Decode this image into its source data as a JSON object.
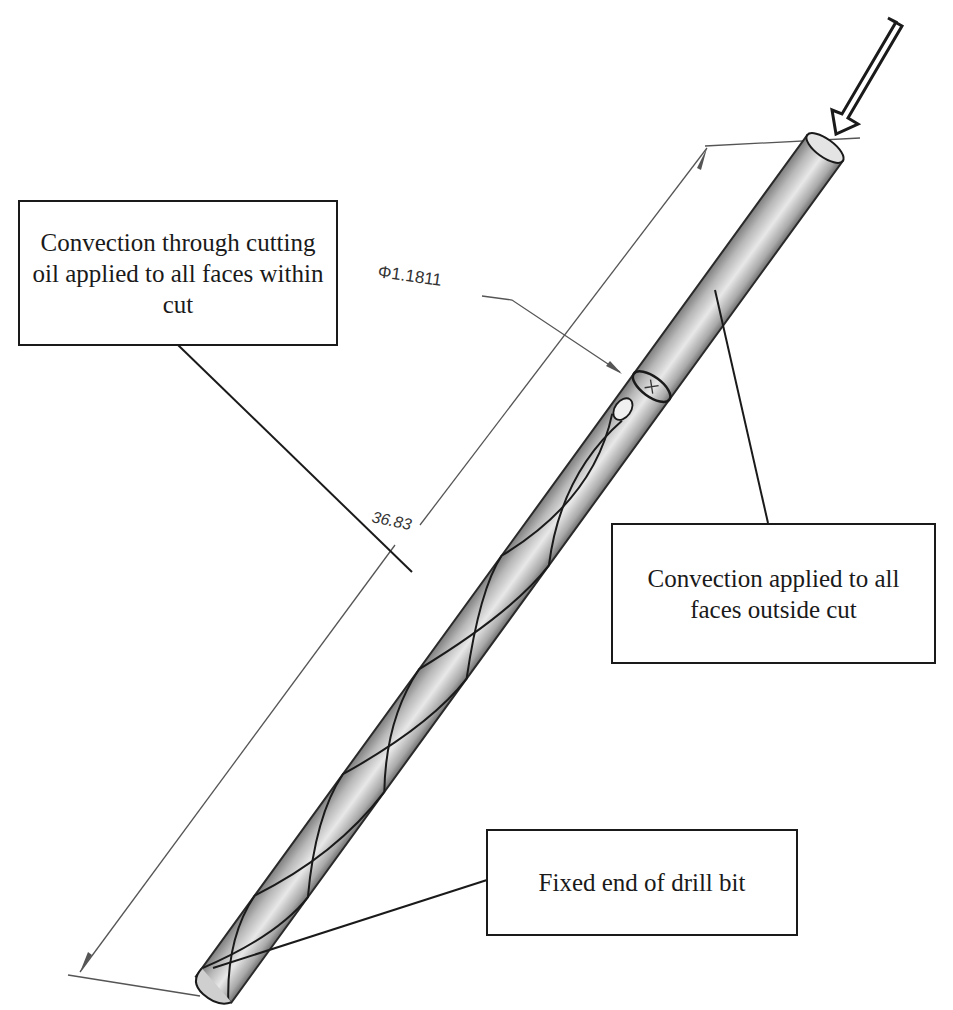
{
  "diagram": {
    "callouts": {
      "within_cut": {
        "text": "Convection through cutting oil applied to all faces within cut"
      },
      "outside_cut": {
        "text": "Convection applied to all faces outside cut"
      },
      "fixed_end": {
        "text": "Fixed end of drill bit"
      }
    },
    "dimensions": {
      "diameter": {
        "label": "Φ1.1811"
      },
      "length": {
        "label": "36.83"
      }
    },
    "load_arrow": {
      "direction": "down-left, into top face of shank"
    },
    "colors": {
      "ink": "#1a1a1a",
      "dimension_line": "#555555",
      "body_light": "#e6e6e6",
      "body_mid": "#bdbdbd",
      "body_dark": "#8a8a8a"
    }
  }
}
